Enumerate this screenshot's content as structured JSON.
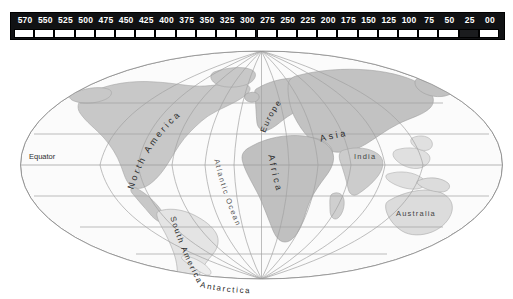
{
  "timescale": {
    "name": "geologic-time-scale",
    "unit_note": "Ma",
    "ticks": [
      {
        "label": "570",
        "value": 570
      },
      {
        "label": "550",
        "value": 550
      },
      {
        "label": "525",
        "value": 525
      },
      {
        "label": "500",
        "value": 500
      },
      {
        "label": "475",
        "value": 475
      },
      {
        "label": "450",
        "value": 450
      },
      {
        "label": "425",
        "value": 425
      },
      {
        "label": "400",
        "value": 400
      },
      {
        "label": "375",
        "value": 375
      },
      {
        "label": "350",
        "value": 350
      },
      {
        "label": "325",
        "value": 325
      },
      {
        "label": "300",
        "value": 300
      },
      {
        "label": "275",
        "value": 275
      },
      {
        "label": "250",
        "value": 250
      },
      {
        "label": "225",
        "value": 225
      },
      {
        "label": "200",
        "value": 200
      },
      {
        "label": "175",
        "value": 175
      },
      {
        "label": "150",
        "value": 150
      },
      {
        "label": "125",
        "value": 125
      },
      {
        "label": "100",
        "value": 100
      },
      {
        "label": "75",
        "value": 75
      },
      {
        "label": "50",
        "value": 50
      },
      {
        "label": "25",
        "value": 25
      },
      {
        "label": "00",
        "value": 0
      }
    ],
    "selected_segment_index": 22,
    "selected_segment_range": "50-25",
    "bar_color": "#111214",
    "label_color": "#ffffff",
    "segment_color": "#ffffff",
    "segment_highlight_color": "#1b1c1e"
  },
  "map": {
    "name": "world-map-mollweide",
    "projection": "mollweide",
    "background": "#ffffff",
    "ocean_fill": "#fbfbfb",
    "graticule_color": "#9a9a9a",
    "outline_color": "#8d8d8d",
    "landmass_light_fill": "#e2e2e2",
    "landmass_dark_fill": "#c4c4c4",
    "landmass_stroke": "#9e9e9e",
    "labels": {
      "equator": "Equator",
      "north_america": "North America",
      "south_america": "South America",
      "europe": "Europe",
      "asia": "Asia",
      "africa": "Africa",
      "india": "India",
      "australia": "Australia",
      "antarctica": "Antarctica",
      "atlantic_ocean": "Atlantic Ocean"
    }
  }
}
